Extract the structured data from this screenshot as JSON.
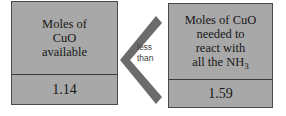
{
  "diagram": {
    "type": "comparison",
    "background_color": "#ffffff",
    "box_fill_color": "#a8a8a8",
    "box_border_color": "#4a4a4a",
    "text_color": "#171717",
    "left_box": {
      "label_lines": [
        "Moles of",
        "CuO",
        "available"
      ],
      "value": "1.14"
    },
    "comparator": {
      "icon": "chevron-left-icon",
      "symbol": "<",
      "label_lines": [
        "less",
        "than"
      ],
      "color": "#6b6b6b"
    },
    "right_box": {
      "label_lines": [
        "Moles of CuO",
        "needed to",
        "react with"
      ],
      "formula_line": {
        "prefix": "all the NH",
        "subscript": "3"
      },
      "value": "1.59"
    }
  }
}
